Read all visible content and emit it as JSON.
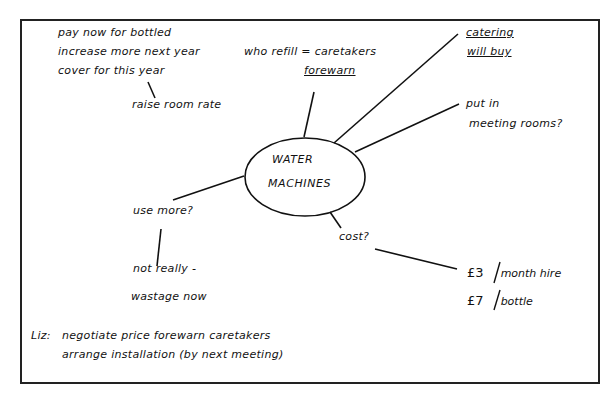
{
  "center": {
    "line1": "WATER",
    "line2": "MACHINES"
  },
  "topleft": {
    "line1": "pay now for bottled",
    "line2": "increase more next year",
    "line3": "cover for this year",
    "sub": "raise room rate"
  },
  "refill": {
    "line1": "who refill = caretakers",
    "line2": "forewarn"
  },
  "catering": {
    "line1": "catering",
    "line2": "will buy"
  },
  "meeting": {
    "line1": "put in",
    "line2": "meeting rooms?"
  },
  "usemore": {
    "q": "use more?",
    "a1": "not really -",
    "a2": "wastage now"
  },
  "cost": {
    "q": "cost?",
    "items": [
      {
        "amount": "£3",
        "unit": "month hire"
      },
      {
        "amount": "£7",
        "unit": "bottle"
      }
    ]
  },
  "action": {
    "who": "Liz:",
    "line1": "negotiate price  forewarn caretakers",
    "line2": "arrange installation (by next meeting)"
  }
}
